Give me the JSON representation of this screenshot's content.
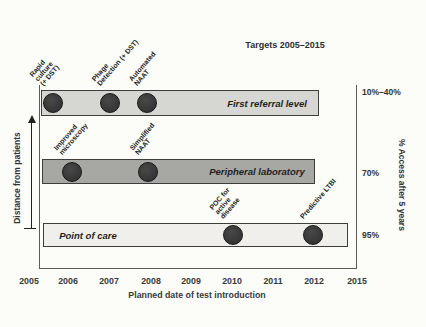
{
  "chart_data": {
    "type": "timeline",
    "title": "Targets 2005–2015",
    "xlabel": "Planned date of test introduction",
    "x_ticks": [
      "2005",
      "2006",
      "2007",
      "2008",
      "2009",
      "2010",
      "2011",
      "2012",
      "2015"
    ],
    "x_range": [
      2005,
      2015
    ],
    "left_axis_label": "Distance from patients",
    "right_axis_label": "% Access after 5 years",
    "series": [
      {
        "level": "First referral level",
        "access_after_5_years": "10%–40%",
        "points": [
          {
            "test": "Rapid culture (+ DST)",
            "label_lines": [
              "Rapid",
              "culture",
              "(+ DST)"
            ],
            "year": 2006,
            "year_drawn": 2005.6
          },
          {
            "test": "Phage Detection (+ DST)",
            "label_lines": [
              "Phage",
              "Detection (+ DST)"
            ],
            "year": 2007,
            "year_drawn": 2007.0
          },
          {
            "test": "Automated NAAT",
            "label_lines": [
              "Automated",
              "NAAT"
            ],
            "year": 2008,
            "year_drawn": 2007.9
          }
        ]
      },
      {
        "level": "Peripheral laboratory",
        "access_after_5_years": "70%",
        "points": [
          {
            "test": "Improved microscopy",
            "label_lines": [
              "Improved",
              "microscopy"
            ],
            "year": 2006,
            "year_drawn": 2006.05
          },
          {
            "test": "Simplified NAAT",
            "label_lines": [
              "Simplified",
              "NAAT"
            ],
            "year": 2008,
            "year_drawn": 2007.93
          }
        ]
      },
      {
        "level": "Point of care",
        "access_after_5_years": "95%",
        "points": [
          {
            "test": "POC for active disease",
            "label_lines": [
              "POC for",
              "active",
              "disease"
            ],
            "year": 2010,
            "year_drawn": 2010.0
          },
          {
            "test": "Predictive LTBI",
            "label_lines": [
              "Predictive LTBI"
            ],
            "year": 2012,
            "year_drawn": 2011.97
          }
        ]
      }
    ],
    "colors": {
      "bar_fills": [
        "#d6d6d2",
        "#a7a7a3",
        "#f0efeb"
      ],
      "dot": "#3a3a3a",
      "bar_border": "#3d3d3d"
    },
    "legend_position": "none",
    "grid": false
  }
}
